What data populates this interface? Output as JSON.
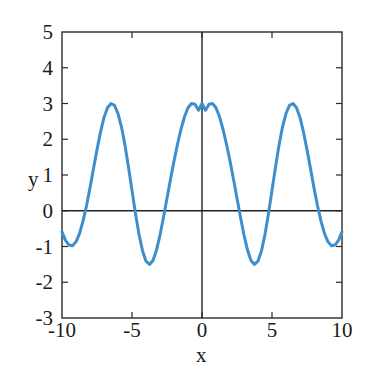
{
  "chart_data": {
    "type": "line",
    "title": "",
    "subtitle": "",
    "xlabel": "x",
    "ylabel": "y",
    "xlim": [
      -10,
      10
    ],
    "ylim": [
      -3,
      5
    ],
    "xticks": [
      -10,
      -5,
      0,
      5,
      10
    ],
    "yticks": [
      -3,
      -2,
      -1,
      0,
      1,
      2,
      3,
      4,
      5
    ],
    "xtick_labels": [
      "-10",
      "-5",
      "0",
      "5",
      "10"
    ],
    "ytick_labels": [
      "-3",
      "-2",
      "-1",
      "0",
      "1",
      "2",
      "3",
      "4",
      "5"
    ],
    "grid": false,
    "legend": null,
    "legend_position": "none",
    "annotations": [],
    "axis_lines": {
      "horizontal_zero": true,
      "vertical_zero": true,
      "color": "#222222"
    },
    "frame": {
      "visible": true,
      "color": "#2b2b2b"
    },
    "series": [
      {
        "name": "y = 2cos(x) + cos(2x)",
        "color": "#3f8ecc",
        "line_width": 3,
        "expression": "2*cos(x) + cos(2*x)",
        "peak_value": 3.0,
        "trough_value": -1.0,
        "period": 6.283,
        "peaks_x": [
          -6.28,
          0,
          6.28
        ],
        "troughs_x": [
          -9.4,
          -3.0,
          3.0,
          9.4
        ],
        "zero_crossings_x": [
          -8.4,
          -4.1,
          -1.9,
          1.9,
          4.1,
          8.4
        ],
        "endpoints": [
          {
            "x": -10,
            "y": -0.6
          },
          {
            "x": 10,
            "y": -0.6
          }
        ],
        "x": [
          -10,
          -9.75,
          -9.5,
          -9.25,
          -9,
          -8.75,
          -8.5,
          -8.25,
          -8,
          -7.75,
          -7.5,
          -7.25,
          -7,
          -6.75,
          -6.5,
          -6.25,
          -6,
          -5.75,
          -5.5,
          -5.25,
          -5,
          -4.75,
          -4.5,
          -4.25,
          -4,
          -3.75,
          -3.5,
          -3.25,
          -3,
          -2.75,
          -2.5,
          -2.25,
          -2,
          -1.75,
          -1.5,
          -1.25,
          -1,
          -0.75,
          -0.5,
          -0.25,
          0,
          0.25,
          0.5,
          0.75,
          1,
          1.25,
          1.5,
          1.75,
          2,
          2.25,
          2.5,
          2.75,
          3,
          3.25,
          3.5,
          3.75,
          4,
          4.25,
          4.5,
          4.75,
          5,
          5.25,
          5.5,
          5.75,
          6,
          6.25,
          6.5,
          6.75,
          7,
          7.25,
          7.5,
          7.75,
          8,
          8.25,
          8.5,
          8.75,
          9,
          9.25,
          9.5,
          9.75,
          10
        ],
        "values": [
          -0.59,
          -0.83,
          -0.96,
          -0.98,
          -0.87,
          -0.64,
          -0.29,
          0.14,
          0.64,
          1.18,
          1.71,
          2.2,
          2.61,
          2.88,
          3.0,
          2.95,
          2.72,
          2.34,
          1.83,
          1.22,
          0.57,
          -0.08,
          -0.66,
          -1.12,
          -1.41,
          -1.5,
          -1.39,
          -1.1,
          -0.68,
          -0.18,
          0.35,
          0.88,
          1.39,
          1.86,
          2.28,
          2.63,
          2.88,
          3.0,
          2.98,
          2.81,
          3.0,
          2.81,
          2.98,
          3.0,
          2.88,
          2.63,
          2.28,
          1.86,
          1.39,
          0.88,
          0.35,
          -0.18,
          -0.68,
          -1.1,
          -1.39,
          -1.5,
          -1.41,
          -1.12,
          -0.66,
          -0.08,
          0.57,
          1.22,
          1.83,
          2.34,
          2.72,
          2.95,
          3.0,
          2.88,
          2.61,
          2.2,
          1.71,
          1.18,
          0.64,
          0.14,
          -0.29,
          -0.64,
          -0.87,
          -0.98,
          -0.96,
          -0.83,
          -0.59
        ]
      }
    ]
  },
  "axis_titles": {
    "x": "x",
    "y": "y"
  }
}
